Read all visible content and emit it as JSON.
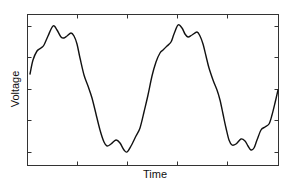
{
  "chart_data": {
    "type": "line",
    "title": "",
    "xlabel": "Time",
    "ylabel": "Voltage",
    "grid": false,
    "legend": null,
    "x_tick_labels": [],
    "y_tick_labels": [],
    "note": "Periodic waveform (~2 cycles) with double-humped peaks and troughs; no numeric tick labels shown. Points are pixel coordinates traced approximately from the screenshot.",
    "frame": {
      "left": 27,
      "top": 14,
      "right": 278,
      "bottom": 165
    },
    "x_ticks_px": [
      77,
      127,
      177,
      227
    ],
    "y_ticks_px": [
      26,
      57,
      89,
      120,
      152
    ],
    "series": [
      {
        "name": "Voltage",
        "color": "#111111",
        "points_px": [
          [
            30,
            74
          ],
          [
            33,
            60
          ],
          [
            37,
            51
          ],
          [
            41,
            48
          ],
          [
            44,
            45
          ],
          [
            48,
            36
          ],
          [
            53,
            26
          ],
          [
            57,
            30
          ],
          [
            61,
            37
          ],
          [
            64,
            38
          ],
          [
            67,
            36
          ],
          [
            71,
            33
          ],
          [
            74,
            36
          ],
          [
            77,
            44
          ],
          [
            80,
            58
          ],
          [
            84,
            75
          ],
          [
            88,
            86
          ],
          [
            92,
            98
          ],
          [
            96,
            114
          ],
          [
            100,
            130
          ],
          [
            104,
            142
          ],
          [
            107,
            146
          ],
          [
            111,
            144
          ],
          [
            116,
            140
          ],
          [
            120,
            143
          ],
          [
            124,
            150
          ],
          [
            127,
            152
          ],
          [
            131,
            146
          ],
          [
            136,
            136
          ],
          [
            140,
            128
          ],
          [
            144,
            112
          ],
          [
            148,
            95
          ],
          [
            152,
            76
          ],
          [
            156,
            62
          ],
          [
            160,
            53
          ],
          [
            163,
            50
          ],
          [
            167,
            46
          ],
          [
            171,
            42
          ],
          [
            174,
            34
          ],
          [
            178,
            25
          ],
          [
            182,
            28
          ],
          [
            185,
            34
          ],
          [
            188,
            37
          ],
          [
            192,
            35
          ],
          [
            197,
            32
          ],
          [
            200,
            36
          ],
          [
            203,
            44
          ],
          [
            206,
            56
          ],
          [
            209,
            68
          ],
          [
            213,
            80
          ],
          [
            217,
            90
          ],
          [
            220,
            100
          ],
          [
            223,
            114
          ],
          [
            226,
            128
          ],
          [
            229,
            140
          ],
          [
            232,
            145
          ],
          [
            236,
            144
          ],
          [
            241,
            139
          ],
          [
            245,
            141
          ],
          [
            248,
            146
          ],
          [
            251,
            150
          ],
          [
            254,
            148
          ],
          [
            257,
            140
          ],
          [
            261,
            130
          ],
          [
            265,
            127
          ],
          [
            269,
            124
          ],
          [
            272,
            115
          ],
          [
            275,
            103
          ],
          [
            278,
            90
          ]
        ]
      }
    ]
  }
}
